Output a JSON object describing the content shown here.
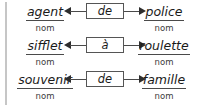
{
  "diagram": {
    "accent_color": "#2d2d2d",
    "rule_color": "#c6c6c6",
    "box_border_color": "#555555",
    "arrow_color": "#4a4a4a",
    "rows": [
      {
        "left_word": "agent",
        "left_pos": "nom",
        "preposition": "de",
        "right_word": "police",
        "right_pos": "nom",
        "left_arrow": "arrow-left",
        "right_arrow": "arrow-right"
      },
      {
        "left_word": "sifflet",
        "left_pos": "nom",
        "preposition": "à",
        "right_word": "roulette",
        "right_pos": "nom",
        "left_arrow": "arrow-left",
        "right_arrow": "arrow-right"
      },
      {
        "left_word": "souvenir",
        "left_pos": "nom",
        "preposition": "de",
        "right_word": "famille",
        "right_pos": "nom",
        "left_arrow": "arrow-left",
        "right_arrow": "arrow-right"
      }
    ]
  }
}
